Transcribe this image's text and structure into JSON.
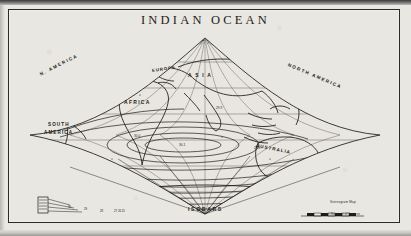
{
  "document": {
    "title": "INDIAN OCEAN",
    "bottom_label": "ISOBARS",
    "paper_color": "#e9e7e1",
    "ink_color": "#1b1a18"
  },
  "map": {
    "projection": "sinusoidal",
    "title": "INDIAN OCEAN",
    "region_labels": [
      {
        "text": "N. AMERICA",
        "x": 40,
        "y": 72,
        "rotate": -27,
        "size": 4.6,
        "spacing": 1.5
      },
      {
        "text": "NORTH AMERICA",
        "x": 288,
        "y": 62,
        "rotate": 23,
        "size": 4.6,
        "spacing": 1.5
      },
      {
        "text": "EUROPE",
        "x": 152,
        "y": 68,
        "rotate": -8,
        "size": 4.4,
        "spacing": 0.9
      },
      {
        "text": "A S I A",
        "x": 188,
        "y": 72,
        "rotate": 0,
        "size": 5.0,
        "spacing": 1.2
      },
      {
        "text": "AFRICA",
        "x": 124,
        "y": 99,
        "rotate": 0,
        "size": 5.0,
        "spacing": 1.3
      },
      {
        "text": "SOUTH",
        "x": 48,
        "y": 122,
        "rotate": 0,
        "size": 4.6,
        "spacing": 1.1
      },
      {
        "text": "AMERICA",
        "x": 44,
        "y": 130,
        "rotate": 0,
        "size": 4.6,
        "spacing": 1.1
      },
      {
        "text": "AUSTRALIA",
        "x": 256,
        "y": 143,
        "rotate": 11,
        "size": 4.6,
        "spacing": 1.0
      }
    ],
    "scale_bar": {
      "caption_top": "Stereogram Map",
      "caption_bottom": "on Reverse of Inverse"
    },
    "legend_present": true,
    "isobar_labels": [
      "30.1",
      "30.0",
      "29.9",
      "29.8",
      "29.7",
      "29.6",
      "29.5",
      "29.4",
      "29.3",
      "29.2",
      "29.1",
      "29.0"
    ]
  },
  "chart_data": {
    "type": "map",
    "title": "INDIAN OCEAN",
    "subtitle": "ISOBARS",
    "projection": "sinusoidal",
    "grid": true,
    "xlabel": "",
    "ylabel": "",
    "continents": [
      "N. AMERICA",
      "NORTH AMERICA",
      "EUROPE",
      "A S I A",
      "AFRICA",
      "SOUTH AMERICA",
      "AUSTRALIA"
    ],
    "contour_label": "ISOBARS",
    "contour_values": [
      30.1,
      30.0,
      29.9,
      29.8,
      29.7,
      29.6,
      29.5,
      29.4,
      29.3,
      29.2,
      29.1,
      29.0
    ],
    "contour_units": "inches of mercury",
    "center_of_high": {
      "x": 175,
      "y": 136,
      "value": 30.1
    },
    "parallels_y": [
      62,
      88,
      114,
      140,
      166,
      192
    ],
    "meridian_apex": {
      "x": 205,
      "y": 38
    },
    "meridian_base": {
      "x": 205,
      "y": 214
    }
  }
}
